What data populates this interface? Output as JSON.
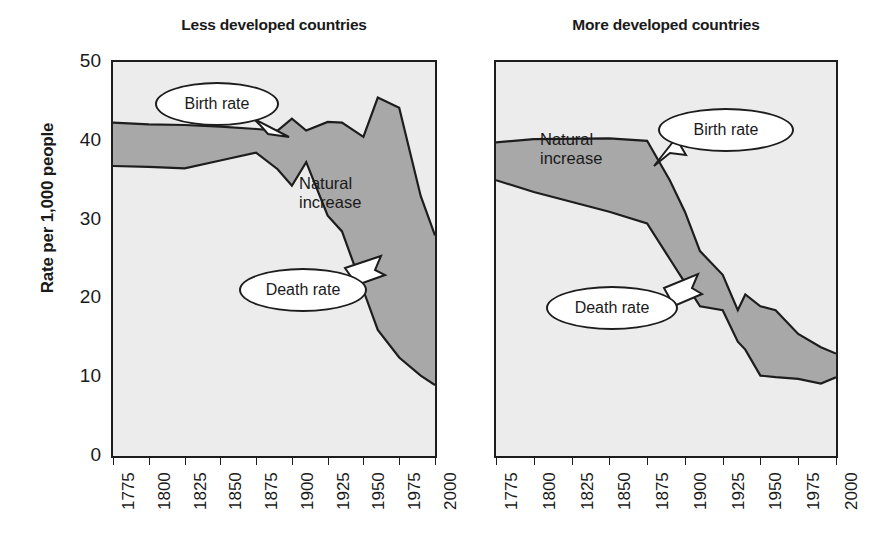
{
  "figure": {
    "ylabel": "Rate per 1,000 people",
    "fill_color": "#a8a8a8",
    "plot_bg": "#ececec",
    "line_color": "#1d1d1d"
  },
  "chart_data": [
    {
      "type": "area",
      "title": "Less developed countries",
      "xlabel": "",
      "ylabel": "Rate per 1,000 people",
      "ylim": [
        0,
        50
      ],
      "xlim": [
        1775,
        2000
      ],
      "grid": false,
      "legend": "callout-labels",
      "xticks": [
        "1775",
        "1800",
        "1825",
        "1850",
        "1875",
        "1900",
        "1925",
        "1950",
        "1975",
        "2000"
      ],
      "yticks": [
        "0",
        "10",
        "20",
        "30",
        "40",
        "50"
      ],
      "x": [
        1775,
        1800,
        1825,
        1850,
        1875,
        1890,
        1900,
        1910,
        1925,
        1935,
        1950,
        1960,
        1975,
        1990,
        2000
      ],
      "series": [
        {
          "name": "Birth rate",
          "values": [
            42.3,
            42.1,
            42.0,
            41.8,
            41.5,
            41.3,
            42.8,
            41.3,
            42.4,
            42.3,
            40.5,
            45.5,
            44.2,
            33.0,
            28.0
          ]
        },
        {
          "name": "Death rate",
          "values": [
            36.8,
            36.7,
            36.5,
            37.5,
            38.5,
            36.4,
            34.3,
            37.3,
            30.5,
            28.5,
            21.0,
            16.0,
            12.5,
            10.2,
            9.0
          ]
        }
      ],
      "annotations": [
        {
          "label": "Birth rate",
          "kind": "callout"
        },
        {
          "label": "Death rate",
          "kind": "callout"
        },
        {
          "label": "Natural\nincrease",
          "line1": "Natural",
          "line2": "increase",
          "kind": "area-label"
        }
      ]
    },
    {
      "type": "area",
      "title": "More developed countries",
      "xlabel": "",
      "ylabel": "",
      "ylim": [
        0,
        50
      ],
      "xlim": [
        1775,
        2000
      ],
      "grid": false,
      "legend": "callout-labels",
      "xticks": [
        "1775",
        "1800",
        "1825",
        "1850",
        "1875",
        "1900",
        "1925",
        "1950",
        "1975",
        "2000"
      ],
      "yticks": [
        "0",
        "10",
        "20",
        "30",
        "40",
        "50"
      ],
      "x": [
        1775,
        1800,
        1850,
        1875,
        1890,
        1900,
        1910,
        1925,
        1935,
        1940,
        1950,
        1960,
        1975,
        1990,
        2000
      ],
      "series": [
        {
          "name": "Birth rate",
          "values": [
            39.8,
            40.2,
            40.3,
            40.0,
            35.0,
            31.0,
            26.0,
            23.0,
            18.5,
            20.5,
            19.0,
            18.5,
            15.5,
            13.8,
            13.0
          ]
        },
        {
          "name": "Death rate",
          "values": [
            35.0,
            33.5,
            31.0,
            29.5,
            25.0,
            22.0,
            19.0,
            18.5,
            14.5,
            13.5,
            10.2,
            10.0,
            9.8,
            9.2,
            10.0
          ]
        }
      ],
      "annotations": [
        {
          "label": "Birth rate",
          "kind": "callout"
        },
        {
          "label": "Death rate",
          "kind": "callout"
        },
        {
          "label": "Natural\nincrease",
          "line1": "Natural",
          "line2": "increase",
          "kind": "area-label"
        }
      ]
    }
  ],
  "left_panel": {
    "title": "Less developed countries",
    "yticks": [
      "50",
      "40",
      "30",
      "20",
      "10",
      "0"
    ],
    "xticks": [
      "1775",
      "1800",
      "1825",
      "1850",
      "1875",
      "1900",
      "1925",
      "1950",
      "1975",
      "2000"
    ],
    "callout_birth": "Birth rate",
    "callout_death": "Death rate",
    "area_label_line1": "Natural",
    "area_label_line2": "increase"
  },
  "right_panel": {
    "title": "More developed countries",
    "xticks": [
      "1775",
      "1800",
      "1825",
      "1850",
      "1875",
      "1900",
      "1925",
      "1950",
      "1975",
      "2000"
    ],
    "callout_birth": "Birth rate",
    "callout_death": "Death rate",
    "area_label_line1": "Natural",
    "area_label_line2": "increase"
  }
}
